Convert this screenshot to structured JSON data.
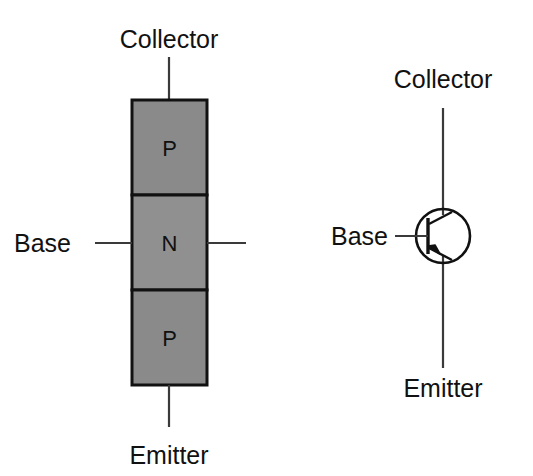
{
  "figure": {
    "background_color": "#ffffff",
    "line_color": "#3a3a3a",
    "outline_color": "#111111",
    "text_color": "#111111",
    "semiconductor_fill": "#8a8a8a",
    "n_region_fill": "#909090"
  },
  "structure_diagram": {
    "name": "pnp-layer-structure",
    "terminals": {
      "collector": "Collector",
      "base": "Base",
      "emitter": "Emitter"
    },
    "layers": [
      {
        "id": "collector-layer",
        "type": "P",
        "label": "P"
      },
      {
        "id": "base-layer",
        "type": "N",
        "label": "N"
      },
      {
        "id": "emitter-layer",
        "type": "P",
        "label": "P"
      }
    ]
  },
  "symbol_diagram": {
    "name": "pnp-schematic-symbol",
    "terminals": {
      "collector": "Collector",
      "base": "Base",
      "emitter": "Emitter"
    },
    "device_type": "PNP",
    "arrow_direction": "into-base"
  }
}
